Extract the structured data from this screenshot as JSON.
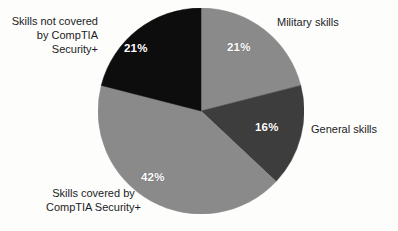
{
  "chart_data": {
    "type": "pie",
    "title": "",
    "subtitle": "",
    "xlabel": "",
    "ylabel": "",
    "grid": false,
    "legend_position": "callout-labels-outside",
    "units": "percent",
    "total": 100,
    "start_angle_deg": 0,
    "direction": "clockwise",
    "categories": [
      "Military skills",
      "General skills",
      "Skills covered by CompTIA Security+",
      "Skills not covered by CompTIA Security+"
    ],
    "values": [
      21,
      16,
      42,
      21
    ],
    "value_labels": [
      "21%",
      "16%",
      "42%",
      "21%"
    ],
    "colors": [
      "#8a8a8a",
      "#3d3d3d",
      "#8a8a8a",
      "#0d0d0d"
    ],
    "slices": [
      {
        "name": "Military skills",
        "value": 21,
        "value_label": "21%",
        "color": "#8a8a8a",
        "label_lines": [
          "Military skills"
        ]
      },
      {
        "name": "General skills",
        "value": 16,
        "value_label": "16%",
        "color": "#3d3d3d",
        "label_lines": [
          "General skills"
        ]
      },
      {
        "name": "Skills covered by CompTIA Security+",
        "value": 42,
        "value_label": "42%",
        "color": "#8a8a8a",
        "label_lines": [
          "Skills covered by",
          "CompTIA Security+"
        ]
      },
      {
        "name": "Skills not covered by CompTIA Security+",
        "value": 21,
        "value_label": "21%",
        "color": "#0d0d0d",
        "label_lines": [
          "Skills not covered",
          "by CompTIA",
          "Security+"
        ]
      }
    ]
  },
  "labels": {
    "not_covered_line1": "Skills not covered",
    "not_covered_line2": "by CompTIA",
    "not_covered_line3": "Security+",
    "military": "Military skills",
    "general": "General skills",
    "covered_line1": "Skills covered by",
    "covered_line2": "CompTIA Security+"
  },
  "values": {
    "military": "21%",
    "general": "16%",
    "covered": "42%",
    "not_covered": "21%"
  },
  "palette": {
    "background": "#fdfdfc",
    "text": "#1c1c1c",
    "value_text": "#ffffff",
    "light_gray": "#8a8a8a",
    "dark_gray": "#3d3d3d",
    "black": "#0d0d0d"
  }
}
